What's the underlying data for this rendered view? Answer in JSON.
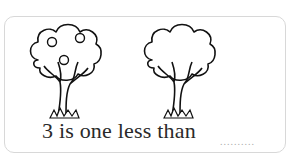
{
  "worksheet": {
    "sentence": "3 is one less than",
    "answer_blank": "..........",
    "trees": [
      {
        "label": "tree-with-apples",
        "apple_count": 3
      },
      {
        "label": "tree-without-apples",
        "apple_count": 0
      }
    ],
    "colors": {
      "line": "#111111",
      "text": "#2a2a2a",
      "border": "#d8d8d8",
      "blank": "#aaaaaa"
    }
  }
}
